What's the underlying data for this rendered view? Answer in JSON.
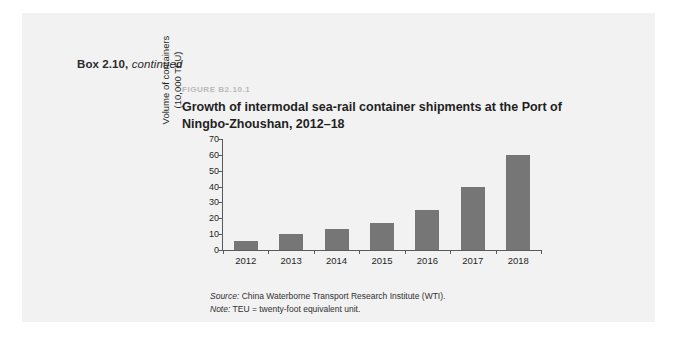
{
  "box": {
    "label": "Box 2.10,",
    "continued": "continued",
    "background_color": "#f2f2f2"
  },
  "figure": {
    "kicker": "FIGURE B2.10.1",
    "title": "Growth of intermodal sea-rail container shipments at the Port of Ningbo-Zhoushan, 2012–18",
    "kicker_color": "#b9b9b9",
    "title_color": "#1f1f1f"
  },
  "footnotes": {
    "source_label": "Source:",
    "source_text": " China Waterborne Transport Research Institute (WTI).",
    "note_label": "Note:",
    "note_text": " TEU = twenty-foot equivalent unit."
  },
  "chart_data": {
    "type": "bar",
    "title": "Growth of intermodal sea-rail container shipments at the Port of Ningbo-Zhoushan, 2012–18",
    "categories": [
      "2012",
      "2013",
      "2014",
      "2015",
      "2016",
      "2017",
      "2018"
    ],
    "values": [
      6,
      10,
      13,
      17,
      25,
      40,
      60
    ],
    "xlabel": "",
    "ylabel": "Volume of containers (10,000 TEU)",
    "ylabel_line1": "Volume of containers",
    "ylabel_line2": "(10,000 TEU)",
    "ylim": [
      0,
      70
    ],
    "yticks": [
      0,
      10,
      20,
      30,
      40,
      50,
      60,
      70
    ],
    "grid": false,
    "legend": "none",
    "bar_color": "#767676",
    "axis_color": "#5a5a5a"
  }
}
